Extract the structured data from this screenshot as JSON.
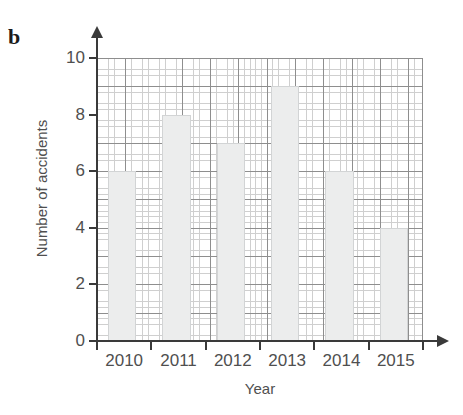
{
  "figure": {
    "part_label": "b"
  },
  "chart_data": {
    "type": "bar",
    "title": "",
    "subtitle": "",
    "categories": [
      "2010",
      "2011",
      "2012",
      "2013",
      "2014",
      "2015"
    ],
    "values": [
      6,
      8,
      7,
      9,
      6,
      4
    ],
    "series": [
      {
        "name": "Number of accidents",
        "values": [
          6,
          8,
          7,
          9,
          6,
          4
        ]
      }
    ],
    "xlabel": "Year",
    "ylabel": "Number of accidents",
    "ylim": [
      0,
      10
    ],
    "ytick_labels": [
      "0",
      "2",
      "4",
      "6",
      "8",
      "10"
    ],
    "ytick_values": [
      0,
      2,
      4,
      6,
      8,
      10
    ],
    "xtick_labels": [
      "2010",
      "2011",
      "2012",
      "2013",
      "2014",
      "2015"
    ],
    "grid": "on",
    "grid_minor": "on",
    "legend": "none",
    "bar_fill_color": "#eceded",
    "bar_edge_color": "#d2d4d5",
    "grid_major_color": "#8e8e8e",
    "grid_minor_color": "#cfcfcf",
    "axis_color": "#3a3a3a",
    "text_color": "#4f4f4f",
    "background_color": "#ffffff"
  }
}
